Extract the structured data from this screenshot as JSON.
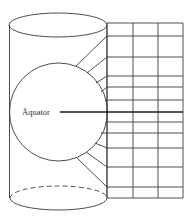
{
  "diagram": {
    "type": "cylindrical-projection",
    "label": "Äquator",
    "colors": {
      "line": "#3a3a3a",
      "equator": "#1a1a1a",
      "label": "#333333",
      "background": "#ffffff"
    },
    "cylinder": {
      "top_ellipse": {
        "cx": 58,
        "cy": 25,
        "rx": 49,
        "ry": 12
      },
      "bottom_ellipse": {
        "cx": 58.5,
        "cy": 198,
        "rx": 48.5,
        "ry": 12,
        "back_half": "dashed"
      },
      "left_x": 9.5,
      "right_x": 107
    },
    "sphere": {
      "cx": 58.5,
      "cy": 112,
      "r": 49
    },
    "grid": {
      "columns_x": [
        107,
        133,
        158,
        183
      ],
      "rows_y": [
        23,
        36,
        57,
        76,
        87,
        100,
        112,
        122,
        133,
        148,
        167,
        187,
        198
      ],
      "equator_row_y": 112
    },
    "projection_lines": [
      {
        "from": [
          76,
          66
        ],
        "to": [
          107,
          36
        ]
      },
      {
        "from": [
          87,
          73
        ],
        "to": [
          107,
          57
        ]
      },
      {
        "from": [
          96,
          83
        ],
        "to": [
          107,
          76
        ]
      },
      {
        "from": [
          101,
          92
        ],
        "to": [
          107,
          87
        ]
      },
      {
        "from": [
          105,
          101
        ],
        "to": [
          107,
          100
        ]
      },
      {
        "from": [
          105,
          123
        ],
        "to": [
          107,
          122
        ]
      },
      {
        "from": [
          101,
          133
        ],
        "to": [
          107,
          133
        ]
      },
      {
        "from": [
          95,
          143
        ],
        "to": [
          107,
          148
        ]
      },
      {
        "from": [
          86,
          152
        ],
        "to": [
          107,
          167
        ]
      },
      {
        "from": [
          77,
          158
        ],
        "to": [
          107,
          187
        ]
      }
    ],
    "equator_line": {
      "x1": 60,
      "x2": 183,
      "y": 112
    },
    "label_position": {
      "x": 22,
      "y": 115
    }
  }
}
